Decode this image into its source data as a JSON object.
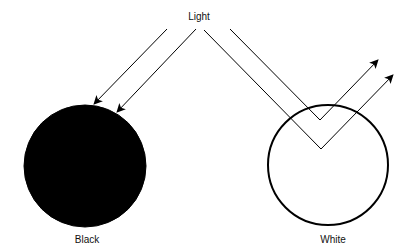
{
  "title_label": "Light",
  "objects": [
    {
      "label": "Black",
      "fill": "#000000",
      "stroke": "#000000",
      "cx": 85,
      "cy": 166,
      "r": 61,
      "behavior": "absorbs"
    },
    {
      "label": "White",
      "fill": "#ffffff",
      "stroke": "#000000",
      "cx": 328,
      "cy": 165,
      "r": 60,
      "behavior": "reflects"
    }
  ],
  "rays": {
    "absorbed": [
      {
        "from": [
          167,
          29
        ],
        "to": [
          94,
          104
        ]
      },
      {
        "from": [
          196,
          29
        ],
        "to": [
          117,
          112
        ]
      }
    ],
    "reflected": [
      {
        "from": [
          230,
          29
        ],
        "vertex": [
          320,
          120
        ],
        "to": [
          378,
          60
        ]
      },
      {
        "from": [
          204,
          30
        ],
        "vertex": [
          321,
          149
        ],
        "to": [
          393,
          75
        ]
      }
    ]
  },
  "colors": {
    "line": "#000000",
    "background": "#ffffff"
  }
}
